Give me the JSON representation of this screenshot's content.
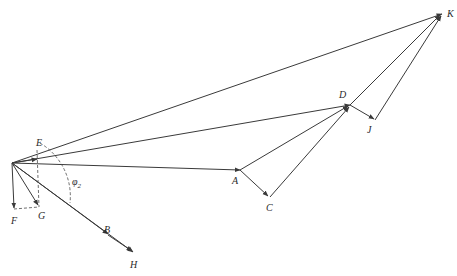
{
  "diagram": {
    "type": "vector-polygon",
    "origin": {
      "x": 12,
      "y": 163
    },
    "colors": {
      "line": "#3a3a3a",
      "label": "#2a2a2a",
      "background": "#ffffff"
    },
    "labels": {
      "A": "A",
      "B": "B",
      "C": "C",
      "D": "D",
      "E": "E",
      "F": "F",
      "G": "G",
      "H": "H",
      "J": "J",
      "K": "K",
      "phi": "φ",
      "phi_sub": "2"
    },
    "points": {
      "O": [
        12,
        163
      ],
      "A": [
        240,
        170
      ],
      "B": [
        108,
        235
      ],
      "C": [
        270,
        197
      ],
      "D": [
        350,
        105
      ],
      "E": [
        37,
        160
      ],
      "F": [
        14,
        210
      ],
      "G": [
        39,
        207
      ],
      "H": [
        133,
        253
      ],
      "J": [
        375,
        120
      ],
      "K": [
        442,
        14
      ]
    },
    "vectors": [
      {
        "from": "O",
        "to": "A"
      },
      {
        "from": "A",
        "to": "C"
      },
      {
        "from": "C",
        "to": "D"
      },
      {
        "from": "A",
        "to": "D"
      },
      {
        "from": "O",
        "to": "D"
      },
      {
        "from": "D",
        "to": "J"
      },
      {
        "from": "J",
        "to": "K"
      },
      {
        "from": "D",
        "to": "K"
      },
      {
        "from": "O",
        "to": "K"
      },
      {
        "from": "O",
        "to": "B"
      },
      {
        "from": "B",
        "to": "H"
      },
      {
        "from": "O",
        "to": "H"
      },
      {
        "from": "O",
        "to": "F"
      },
      {
        "from": "O",
        "to": "G"
      },
      {
        "from": "O",
        "to": "E"
      }
    ],
    "dashed": [
      {
        "desc": "E-G vertical dashed line"
      },
      {
        "desc": "F-G horizontal dashed line"
      },
      {
        "desc": "angle arc phi2"
      }
    ]
  }
}
